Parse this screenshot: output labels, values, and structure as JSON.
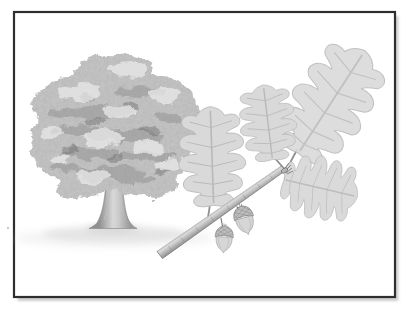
{
  "figure": {
    "style": "grayscale botanical illustration in a thin black frame",
    "tree_count": 1,
    "leaf_count": 4,
    "acorn_count": 2
  },
  "palette": {
    "page_background": "#ffffff",
    "frame_border": "#2e2e2e",
    "frame_fill": "#ffffff",
    "frame_shadow": "#c6c6c6",
    "canopy_base": "#c4c4c4",
    "canopy_shade": "#878787",
    "canopy_dark": "#6e6e6e",
    "canopy_highlight": "#eaeaea",
    "canopy_speckle": "#6b6b6b",
    "trunk_light": "#d8d8d8",
    "trunk_dark": "#8f8f8f",
    "ground_shadow": "#cfcfcf",
    "leaf_fill": "#d9d9d9",
    "leaf_edge": "#b8b8b8",
    "leaf_vein": "#b4b4b4",
    "stem": "#8f8f8f",
    "twig_light": "#d6d6d6",
    "twig_mid": "#ababab",
    "twig_dark": "#6f6f6f",
    "acorn_cap": "#bdbdbd",
    "acorn_nut": "#d6d6d6",
    "acorn_line": "#7e7e7e",
    "stray_mark": "#b9b9b9"
  }
}
